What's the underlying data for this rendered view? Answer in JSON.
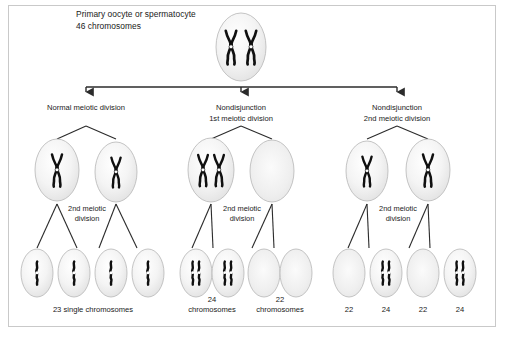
{
  "figure": {
    "title_line1": "Primary oocyte or spermatocyte",
    "title_line2": "46 chromosomes",
    "branches": [
      {
        "id": "normal",
        "label_line1": "Normal meiotic division",
        "label_line2": ""
      },
      {
        "id": "nd-first",
        "label_line1": "Nondisjunction",
        "label_line2": "1st meiotic division"
      },
      {
        "id": "nd-second",
        "label_line1": "Nondisjunction",
        "label_line2": "2nd meiotic division"
      }
    ],
    "stage_label_line1": "2nd meiotic",
    "stage_label_line2": "division",
    "gamete_labels": [
      {
        "id": "normal",
        "line1": "23 single chromosomes",
        "line2": ""
      },
      {
        "id": "nd1-24",
        "line1": "24",
        "line2": "chromosomes"
      },
      {
        "id": "nd1-22",
        "line1": "22",
        "line2": "chromosomes"
      },
      {
        "id": "nd2-a",
        "line1": "22",
        "line2": ""
      },
      {
        "id": "nd2-b",
        "line1": "24",
        "line2": ""
      },
      {
        "id": "nd2-c",
        "line1": "22",
        "line2": ""
      },
      {
        "id": "nd2-d",
        "line1": "24",
        "line2": ""
      }
    ],
    "cells": {
      "primary": {
        "content": "two-bivalent-chromosomes"
      },
      "secondary": [
        {
          "branch": "normal",
          "content": "one-x-chromosome"
        },
        {
          "branch": "normal",
          "content": "one-x-chromosome"
        },
        {
          "branch": "nd-first",
          "content": "two-x-chromosomes"
        },
        {
          "branch": "nd-first",
          "content": "empty"
        },
        {
          "branch": "nd-second",
          "content": "one-x-chromosome"
        },
        {
          "branch": "nd-second",
          "content": "one-x-chromosome"
        }
      ],
      "gametes": [
        {
          "branch": "normal",
          "content": "single-chromatid"
        },
        {
          "branch": "normal",
          "content": "single-chromatid"
        },
        {
          "branch": "normal",
          "content": "single-chromatid"
        },
        {
          "branch": "normal",
          "content": "single-chromatid"
        },
        {
          "branch": "nd-first",
          "content": "double-chromatid"
        },
        {
          "branch": "nd-first",
          "content": "double-chromatid"
        },
        {
          "branch": "nd-first",
          "content": "empty"
        },
        {
          "branch": "nd-first",
          "content": "empty"
        },
        {
          "branch": "nd-second",
          "content": "empty"
        },
        {
          "branch": "nd-second",
          "content": "double-chromatid"
        },
        {
          "branch": "nd-second",
          "content": "empty"
        },
        {
          "branch": "nd-second",
          "content": "double-chromatid"
        }
      ]
    },
    "colors": {
      "frame": "#c9c9c9",
      "chromosome": "#101010",
      "cell_fill": "#f2f2f2",
      "cell_stroke": "#bdbdbd",
      "connector": "#2b2b2b",
      "text": "#1a1a1a"
    }
  }
}
